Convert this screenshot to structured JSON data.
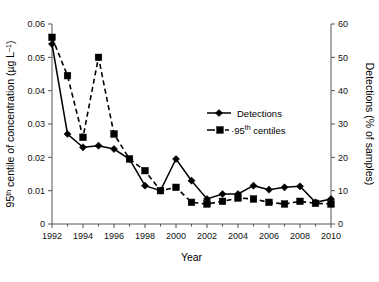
{
  "chart_data": {
    "type": "line",
    "title": "",
    "xlabel": "Year",
    "ylabel": "95th centile of concentration (µg L⁻¹)",
    "ylabel_main": "95",
    "ylabel_sup": "th",
    "ylabel_rest": " centile of concentration (µg L",
    "ylabel_exp": "–1",
    "ylabel_tail": ")",
    "y2label": "Detections (% of samples)",
    "x": [
      1992,
      1993,
      1994,
      1995,
      1996,
      1997,
      1998,
      1999,
      2000,
      2001,
      2002,
      2003,
      2004,
      2005,
      2006,
      2007,
      2008,
      2009,
      2010
    ],
    "xticks": [
      1992,
      1994,
      1996,
      1998,
      2000,
      2002,
      2004,
      2006,
      2008,
      2010
    ],
    "xticklabels": [
      "1992",
      "1994",
      "1996",
      "1998",
      "2000",
      "2002",
      "2004",
      "2006",
      "2008",
      "2010"
    ],
    "xlim": [
      1992,
      2010
    ],
    "yticks": [
      0,
      0.01,
      0.02,
      0.03,
      0.04,
      0.05,
      0.06
    ],
    "yticklabels": [
      "0",
      "0.01",
      "0.02",
      "0.03",
      "0.04",
      "0.05",
      "0.06"
    ],
    "ylim": [
      0,
      0.06
    ],
    "y2ticks": [
      0,
      10,
      20,
      30,
      40,
      50,
      60
    ],
    "y2ticklabels": [
      "0",
      "10",
      "20",
      "30",
      "40",
      "50",
      "60"
    ],
    "y2lim": [
      0,
      60
    ],
    "grid": false,
    "legend_position": "upper-right-inside",
    "series": [
      {
        "name": "Detections",
        "legend_label": "Detections",
        "axis": "right",
        "marker": "diamond",
        "linestyle": "solid",
        "color": "#000000",
        "values": [
          54.0,
          27.0,
          23.0,
          23.5,
          22.5,
          19.5,
          11.5,
          10.0,
          19.5,
          13.0,
          7.5,
          9.0,
          9.0,
          11.5,
          10.3,
          11.0,
          11.3,
          6.5,
          7.5
        ]
      },
      {
        "name": "95th centiles",
        "legend_label": "·95th centiles",
        "legend_label_main": "·95",
        "legend_label_sup": "th",
        "legend_label_rest": " centiles",
        "axis": "left",
        "marker": "square",
        "linestyle": "dashed",
        "color": "#000000",
        "values": [
          0.056,
          0.0445,
          0.026,
          0.05,
          0.027,
          0.0195,
          0.016,
          0.01,
          0.011,
          0.0065,
          0.006,
          0.0068,
          0.0078,
          0.0075,
          0.0065,
          0.006,
          0.0068,
          0.0062,
          0.006
        ]
      }
    ]
  }
}
